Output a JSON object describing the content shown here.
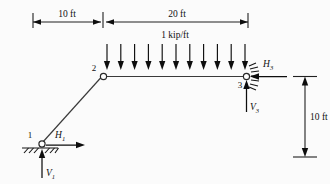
{
  "figure": {
    "type": "free-body-diagram",
    "background_color": "#fbfbfb",
    "line_color": "#3a3a3a",
    "ink_color": "#0d0d0d"
  },
  "dimensions": {
    "horizontal_left": {
      "label": "10 ft",
      "value": 10,
      "unit": "ft"
    },
    "horizontal_right": {
      "label": "20 ft",
      "value": 20,
      "unit": "ft"
    },
    "vertical_right": {
      "label": "10 ft",
      "value": 10,
      "unit": "ft"
    }
  },
  "load": {
    "label": "1 kip/ft",
    "magnitude": 1,
    "unit": "kip/ft",
    "direction": "downward",
    "arrow_count": 11,
    "applied_to": "member-2-3"
  },
  "joints": [
    {
      "id": "1",
      "label": "1",
      "type": "pin-support"
    },
    {
      "id": "2",
      "label": "2",
      "type": "hinge"
    },
    {
      "id": "3",
      "label": "3",
      "type": "pin-support"
    }
  ],
  "reactions": [
    {
      "name": "H1",
      "base": "H",
      "sub": "1",
      "direction": "right",
      "at_joint": "1"
    },
    {
      "name": "V1",
      "base": "V",
      "sub": "1",
      "direction": "up",
      "at_joint": "1"
    },
    {
      "name": "H3",
      "base": "H",
      "sub": "3",
      "direction": "left",
      "at_joint": "3"
    },
    {
      "name": "V3",
      "base": "V",
      "sub": "3",
      "direction": "up",
      "at_joint": "3"
    }
  ],
  "members": [
    {
      "name": "member-1-2",
      "from": "1",
      "to": "2",
      "orientation": "inclined"
    },
    {
      "name": "member-2-3",
      "from": "2",
      "to": "3",
      "orientation": "horizontal"
    }
  ]
}
